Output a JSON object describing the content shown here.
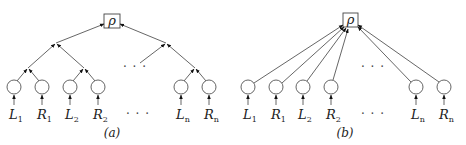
{
  "panels": [
    {
      "id": "a",
      "caption": "(a)",
      "root_label": "ρ",
      "structure": "binary-tree",
      "leaf_labels": [
        {
          "main": "L",
          "sub": "1"
        },
        {
          "main": "R",
          "sub": "1"
        },
        {
          "main": "L",
          "sub": "2"
        },
        {
          "main": "R",
          "sub": "2"
        },
        {
          "main": "L",
          "sub": "n"
        },
        {
          "main": "R",
          "sub": "n"
        }
      ],
      "ellipsis_upper": "· · ·",
      "ellipsis_lower": "· · ·"
    },
    {
      "id": "b",
      "caption": "(b)",
      "root_label": "ρ",
      "structure": "star",
      "leaf_labels": [
        {
          "main": "L",
          "sub": "1"
        },
        {
          "main": "R",
          "sub": "1"
        },
        {
          "main": "L",
          "sub": "2"
        },
        {
          "main": "R",
          "sub": "2"
        },
        {
          "main": "L",
          "sub": "n"
        },
        {
          "main": "R",
          "sub": "n"
        }
      ],
      "ellipsis_upper": "· · ·",
      "ellipsis_lower": "· · ·"
    }
  ]
}
